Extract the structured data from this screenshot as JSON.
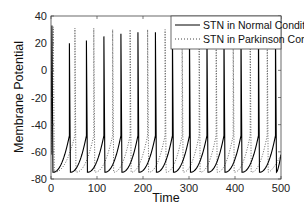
{
  "chart_data": {
    "type": "line",
    "title": "",
    "xlabel": "Time",
    "ylabel": "Membrane Potential",
    "xlim": [
      0,
      500
    ],
    "ylim": [
      -80,
      40
    ],
    "xticks": [
      0,
      100,
      200,
      300,
      400,
      500
    ],
    "yticks": [
      -80,
      -60,
      -40,
      -20,
      0,
      20,
      40
    ],
    "grid": false,
    "legend_position": "upper right",
    "rest_potential": -75,
    "series": [
      {
        "name": "STN in Normal Condition",
        "style": "solid",
        "color": "#000000",
        "spike_times": [
          2,
          40,
          77,
          115,
          152,
          189,
          227,
          264,
          301,
          339,
          376,
          413,
          451,
          488
        ],
        "spike_peaks": [
          33,
          20,
          22,
          25,
          27,
          28,
          28,
          29,
          29,
          29,
          30,
          30,
          30,
          30
        ]
      },
      {
        "name": "STN in Parkinson Condition",
        "style": "dotted",
        "color": "#555555",
        "spike_times": [
          5,
          52,
          93,
          134,
          172,
          210,
          248,
          285,
          322,
          359,
          396,
          433,
          470
        ],
        "spike_peaks": [
          32,
          31,
          31,
          30,
          30,
          30,
          30,
          30,
          30,
          30,
          30,
          30,
          30
        ]
      }
    ]
  },
  "legend": {
    "items": [
      {
        "label": "STN in Normal Condition",
        "style": "solid"
      },
      {
        "label": "STN in Parkinson Condition",
        "style": "dotted"
      }
    ]
  },
  "axes": {
    "xlabel": "Time",
    "ylabel": "Membrane Potential",
    "xtick_labels": [
      "0",
      "100",
      "200",
      "300",
      "400",
      "500"
    ],
    "ytick_labels": [
      "-80",
      "-60",
      "-40",
      "-20",
      "0",
      "20",
      "40"
    ]
  }
}
